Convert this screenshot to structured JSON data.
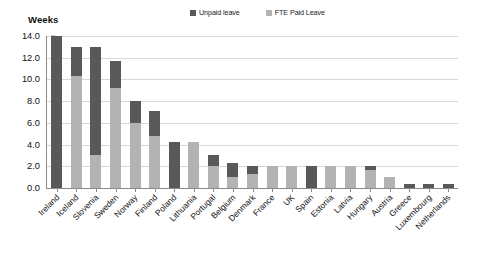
{
  "chart_data": {
    "type": "bar",
    "subtype": "stacked-vertical",
    "title": "",
    "ylabel": "Weeks",
    "xlabel": "",
    "ylim": [
      0,
      14
    ],
    "yticks": [
      "0.0",
      "2.0",
      "4.0",
      "6.0",
      "8.0",
      "10.0",
      "12.0",
      "14.0"
    ],
    "ytick_values": [
      0,
      2,
      4,
      6,
      8,
      10,
      12,
      14
    ],
    "grid": true,
    "legend_position": "top-center",
    "categories": [
      "Ireland",
      "Iceland",
      "Slovenia",
      "Sweden",
      "Norway",
      "Finland",
      "Poland",
      "Lithuania",
      "Portugal",
      "Belgium",
      "Denmark",
      "France",
      "UK",
      "Spain",
      "Estonia",
      "Latvia",
      "Hungary",
      "Austria",
      "Greece",
      "Luxembourg",
      "Netherlands"
    ],
    "series": [
      {
        "name": "FTE Paid Leave",
        "color": "#b3b3b3",
        "values": [
          0.0,
          10.3,
          3.0,
          9.2,
          6.0,
          4.8,
          0.0,
          4.2,
          2.0,
          1.0,
          1.3,
          2.0,
          2.0,
          0.0,
          2.0,
          2.0,
          1.7,
          1.0,
          0.0,
          0.0,
          0.0
        ]
      },
      {
        "name": "Unpaid leave",
        "color": "#595959",
        "values": [
          14.0,
          2.7,
          10.0,
          2.5,
          2.0,
          2.3,
          4.2,
          0.0,
          1.0,
          1.3,
          0.7,
          0.0,
          0.0,
          2.0,
          0.0,
          0.0,
          0.3,
          0.0,
          0.4,
          0.4,
          0.4
        ]
      }
    ],
    "totals": [
      14.0,
      13.0,
      13.0,
      11.7,
      8.0,
      7.1,
      4.2,
      4.2,
      3.0,
      2.3,
      2.0,
      2.0,
      2.0,
      2.0,
      2.0,
      2.0,
      2.0,
      1.0,
      0.4,
      0.4,
      0.4
    ]
  },
  "legend": {
    "entries": [
      {
        "label": "Unpaid leave",
        "color": "#595959",
        "swatch_icon": "square-swatch-icon"
      },
      {
        "label": "FTE Paid Leave",
        "color": "#b3b3b3",
        "swatch_icon": "square-swatch-icon"
      }
    ]
  },
  "axis": {
    "y_title": "Weeks"
  },
  "colors": {
    "unpaid": "#595959",
    "paid": "#b3b3b3",
    "grid": "#d8d8d8",
    "axis": "#8a8a8a",
    "background": "#ffffff",
    "text": "#111111"
  }
}
